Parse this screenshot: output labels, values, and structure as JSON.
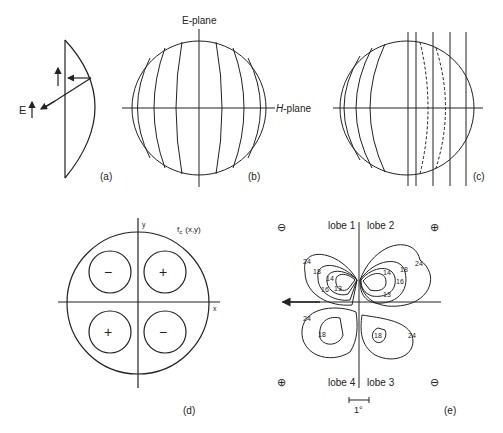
{
  "panels": {
    "a": {
      "label": "(a)",
      "field_label": "E"
    },
    "b": {
      "label": "(b)",
      "e_plane": "E-plane",
      "h_plane_italic": "H",
      "h_plane_rest": "-plane"
    },
    "c": {
      "label": "(c)"
    },
    "d": {
      "label": "(d)",
      "function_label": "f",
      "function_sub": "c",
      "function_args": "(x,y)",
      "x_axis": "x",
      "y_axis": "y",
      "quadrant_signs": {
        "upper_left": "−",
        "upper_right": "+",
        "lower_left": "+",
        "lower_right": "−"
      }
    },
    "e": {
      "label": "(e)",
      "lobes": {
        "lobe1": "lobe 1",
        "lobe2": "lobe 2",
        "lobe3": "lobe 3",
        "lobe4": "lobe 4"
      },
      "corner_signs": {
        "upper_left": "⊖",
        "upper_right": "⊕",
        "lower_left": "⊕",
        "lower_right": "⊖"
      },
      "contour_labels": {
        "l24a": "24",
        "l18a": "18",
        "l14a": "14",
        "l16a": "16",
        "l13a": "13",
        "l14b": "14",
        "l18b": "18",
        "l16b": "16",
        "l13b": "13",
        "l24b": "24",
        "l24c": "24",
        "l18c": "18",
        "l18d": "18",
        "l24d": "24"
      },
      "scale_label": "1°"
    }
  }
}
